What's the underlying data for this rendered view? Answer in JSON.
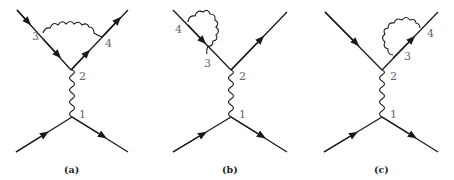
{
  "figure": {
    "colors": {
      "line": "#1a1a1a",
      "label": "#666666",
      "caption": "#222222"
    },
    "diagrams": [
      {
        "caption": "(a)",
        "description": "vertex correction: photon loop between incoming (3) and outgoing (4) upper fermion lines",
        "labels": {
          "v1": "1",
          "v2": "2",
          "v3": "3",
          "v4": "4"
        }
      },
      {
        "caption": "(b)",
        "description": "self-energy on incoming upper fermion line between 4 and 3",
        "labels": {
          "v1": "1",
          "v2": "2",
          "v3": "3",
          "v4": "4"
        }
      },
      {
        "caption": "(c)",
        "description": "self-energy on outgoing upper fermion line between 3 and 4",
        "labels": {
          "v1": "1",
          "v2": "2",
          "v3": "3",
          "v4": "4"
        }
      }
    ]
  }
}
